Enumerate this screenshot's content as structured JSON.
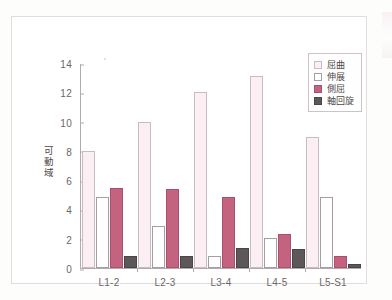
{
  "chart_data": {
    "type": "bar",
    "title": "",
    "xlabel": "",
    "ylabel": "可動域",
    "ylim": [
      0,
      14
    ],
    "yticks": [
      0,
      2,
      4,
      6,
      8,
      10,
      12,
      14
    ],
    "grid": false,
    "legend_position": "top-right",
    "categories": [
      "L1-2",
      "L2-3",
      "L3-4",
      "L4-5",
      "L5-S1"
    ],
    "series": [
      {
        "name": "屈曲",
        "color": "#fbeff3",
        "values": [
          8.0,
          10.0,
          12.1,
          13.2,
          9.0
        ]
      },
      {
        "name": "伸展",
        "color": "#ffffff",
        "values": [
          4.9,
          2.85,
          0.85,
          2.05,
          4.9
        ]
      },
      {
        "name": "側屈",
        "color": "#c4637f",
        "values": [
          5.5,
          5.45,
          4.9,
          2.35,
          0.8
        ]
      },
      {
        "name": "軸回旋",
        "color": "#5c5759",
        "values": [
          0.85,
          0.85,
          1.4,
          1.3,
          0.3
        ]
      }
    ]
  },
  "axis": {
    "y_title": "可動域",
    "tick_labels": [
      "14",
      "12",
      "10",
      "8",
      "6",
      "4",
      "2",
      "0"
    ]
  },
  "legend": {
    "items": [
      {
        "label": "屈曲"
      },
      {
        "label": "伸展"
      },
      {
        "label": "側屈"
      },
      {
        "label": "軸回旋"
      }
    ]
  }
}
